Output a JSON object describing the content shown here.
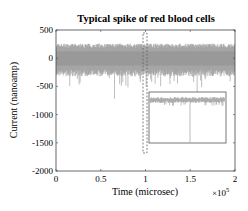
{
  "chart_data": {
    "type": "line",
    "title": "Typical spike of red blood cells",
    "xlabel": "Time (microsec)",
    "ylabel": "Current (nanoamp)",
    "x_multiplier": "×10^5",
    "xlim": [
      0,
      2
    ],
    "ylim": [
      -2000,
      500
    ],
    "xticks": [
      "0",
      "0.5",
      "1",
      "1.5",
      "2"
    ],
    "yticks": [
      "500",
      "0",
      "-500",
      "-1000",
      "-1500",
      "-2000"
    ],
    "grid": false,
    "series": [
      {
        "name": "signal",
        "color": "#999999",
        "baseline": 0,
        "noise_band": [
          -300,
          250
        ],
        "min_spike": -720
      }
    ],
    "annotations": [
      {
        "type": "dashed-rect",
        "x_range": [
          0.98,
          1.02
        ],
        "y_range": [
          400,
          -1750
        ]
      },
      {
        "type": "inset",
        "description": "zoomed spike view",
        "x_range": [
          1.05,
          1.88
        ],
        "y_range": [
          -600,
          -1500
        ]
      }
    ]
  },
  "labels": {
    "title": "Typical spike of red blood cells",
    "xlabel": "Time (microsec)",
    "ylabel": "Current (nanoamp)",
    "mult": "×10",
    "mult_exp": "5",
    "xticks": [
      "0",
      "0.5",
      "1",
      "1.5",
      "2"
    ],
    "yticks": [
      "500",
      "0",
      "-500",
      "-1000",
      "-1500",
      "-2000"
    ]
  }
}
